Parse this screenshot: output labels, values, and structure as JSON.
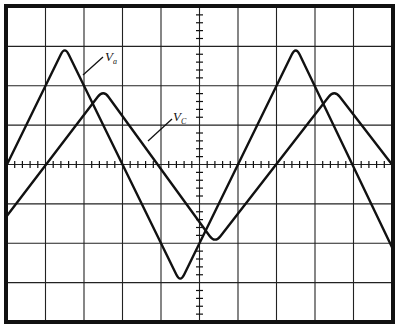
{
  "chart_data": {
    "type": "line",
    "title": "",
    "xlabel": "",
    "ylabel": "",
    "grid": true,
    "grid_divisions": {
      "x": 10,
      "y": 8
    },
    "xlim": [
      0,
      10
    ],
    "ylim": [
      -4,
      4
    ],
    "series": [
      {
        "name": "Va",
        "label_main": "V",
        "label_sub": "a",
        "points": [
          [
            0,
            0
          ],
          [
            1.5,
            3
          ],
          [
            4.5,
            -3
          ],
          [
            7.5,
            3
          ],
          [
            10,
            -2.1
          ]
        ]
      },
      {
        "name": "Vc",
        "label_main": "V",
        "label_sub": "C",
        "points": [
          [
            0,
            -1.3
          ],
          [
            2.5,
            1.9
          ],
          [
            5.4,
            -2.0
          ],
          [
            8.5,
            1.9
          ],
          [
            10,
            0
          ]
        ]
      }
    ],
    "annotations": [
      {
        "text": "Va",
        "x": 2.6,
        "y": 2.6
      },
      {
        "text": "Vc",
        "x": 4.35,
        "y": 1.25
      }
    ]
  },
  "labels": {
    "va_main": "V",
    "va_sub": "a",
    "vc_main": "V",
    "vc_sub": "C"
  },
  "colors": {
    "trace": "#111111",
    "grid": "#222222",
    "background": "#ffffff"
  }
}
